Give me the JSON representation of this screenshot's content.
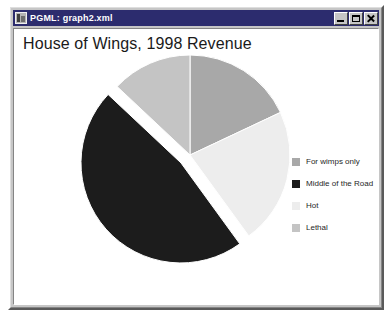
{
  "window": {
    "title": "PGML:  graph2.xml",
    "icon": "document-icon",
    "controls": {
      "minimize_label": "Minimize",
      "maximize_label": "Maximize",
      "close_label": "Close"
    }
  },
  "chart_data": {
    "type": "pie",
    "title": "House of Wings, 1998 Revenue",
    "xlabel": "",
    "ylabel": "",
    "legend_position": "right",
    "grid": false,
    "start_angle_deg": 0,
    "direction": "clockwise",
    "exploded_slice": "Middle of the Road",
    "categories": [
      "For wimps only",
      "Middle of the Road",
      "Hot",
      "Lethal"
    ],
    "values": [
      18,
      47,
      22,
      13
    ],
    "slices": [
      {
        "label": "For wimps only",
        "value": 18,
        "color": "#a8a8a8",
        "exploded": false,
        "start_deg": 0,
        "end_deg": 64.8
      },
      {
        "label": "Hot",
        "value": 22,
        "color": "#ededed",
        "exploded": false,
        "start_deg": 64.8,
        "end_deg": 144.0
      },
      {
        "label": "Middle of the Road",
        "value": 47,
        "color": "#1c1c1c",
        "exploded": true,
        "start_deg": 144.0,
        "end_deg": 313.2
      },
      {
        "label": "Lethal",
        "value": 13,
        "color": "#c4c4c4",
        "exploded": false,
        "start_deg": 313.2,
        "end_deg": 360.0
      }
    ]
  },
  "legend": {
    "items": [
      {
        "label": "For wimps only",
        "color": "#a8a8a8"
      },
      {
        "label": "Middle of the Road",
        "color": "#1c1c1c"
      },
      {
        "label": "Hot",
        "color": "#ededed"
      },
      {
        "label": "Lethal",
        "color": "#c4c4c4"
      }
    ]
  },
  "colors": {
    "titlebar_bg": "#2c2c6e",
    "titlebar_text": "#ffffff",
    "window_face": "#c6c6c6",
    "client_bg": "#ffffff",
    "chart_title_text": "#1a1a1a"
  }
}
